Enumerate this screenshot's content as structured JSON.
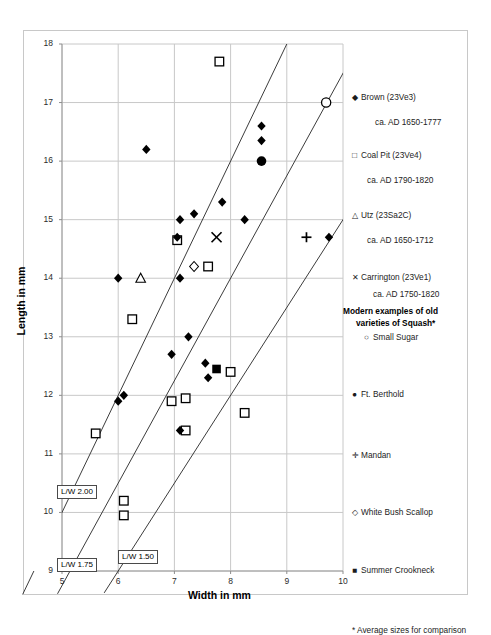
{
  "chart_data": {
    "type": "scatter",
    "title": "",
    "xlabel": "Width in mm",
    "ylabel": "Length in mm",
    "xlim": [
      5,
      10
    ],
    "ylim": [
      9,
      18
    ],
    "xticks": [
      5,
      6,
      7,
      8,
      9,
      10
    ],
    "yticks": [
      9,
      10,
      11,
      12,
      13,
      14,
      15,
      16,
      17,
      18
    ],
    "grid": true,
    "legend_position": "right",
    "series": [
      {
        "name": "Brown (23Ve3)",
        "marker": "filled-diamond",
        "points": [
          [
            6.5,
            16.2
          ],
          [
            8.55,
            16.6
          ],
          [
            8.55,
            16.35
          ],
          [
            7.85,
            15.3
          ],
          [
            7.35,
            15.1
          ],
          [
            8.25,
            15.0
          ],
          [
            7.1,
            15.0
          ],
          [
            7.05,
            14.7
          ],
          [
            9.75,
            14.7
          ],
          [
            6.0,
            14.0
          ],
          [
            7.1,
            14.0
          ],
          [
            7.25,
            13.0
          ],
          [
            6.95,
            12.7
          ],
          [
            7.55,
            12.55
          ],
          [
            7.6,
            12.3
          ],
          [
            6.1,
            12.0
          ],
          [
            6.0,
            11.9
          ],
          [
            7.1,
            11.4
          ]
        ]
      },
      {
        "name": "Coal Pit (23Ve4)",
        "marker": "open-square",
        "points": [
          [
            7.8,
            17.7
          ],
          [
            7.05,
            14.65
          ],
          [
            7.6,
            14.2
          ],
          [
            6.25,
            13.3
          ],
          [
            8.0,
            12.4
          ],
          [
            6.95,
            11.9
          ],
          [
            7.2,
            11.95
          ],
          [
            7.2,
            11.4
          ],
          [
            8.25,
            11.7
          ],
          [
            5.6,
            11.35
          ],
          [
            6.1,
            10.2
          ],
          [
            6.1,
            9.95
          ]
        ]
      },
      {
        "name": "Utz (23Sa2C)",
        "marker": "open-triangle",
        "points": [
          [
            6.4,
            14.0
          ]
        ]
      },
      {
        "name": "Carrington (23Ve1)",
        "marker": "cross-x",
        "points": [
          [
            7.75,
            14.7
          ]
        ]
      },
      {
        "name": "Small Sugar",
        "marker": "open-circle",
        "points": [
          [
            9.7,
            17.0
          ]
        ]
      },
      {
        "name": "Ft. Berthold",
        "marker": "filled-circle",
        "points": [
          [
            8.55,
            16.0
          ]
        ]
      },
      {
        "name": "Mandan",
        "marker": "plus",
        "points": [
          [
            9.35,
            14.7
          ]
        ]
      },
      {
        "name": "White Bush Scallop",
        "marker": "open-diamond",
        "points": [
          [
            7.35,
            14.2
          ]
        ]
      },
      {
        "name": "Summer Crookneck",
        "marker": "filled-square",
        "points": [
          [
            7.75,
            12.45
          ]
        ]
      }
    ],
    "reference_lines": [
      {
        "label": "L/W 2.00",
        "ratio": 2.0
      },
      {
        "label": "L/W 1.75",
        "ratio": 1.75
      },
      {
        "label": "L/W 1.50",
        "ratio": 1.5
      }
    ]
  },
  "axes": {
    "x_title": "Width in mm",
    "y_title": "Length in mm",
    "x_tick_labels": [
      "5",
      "6",
      "7",
      "8",
      "9",
      "10"
    ],
    "y_tick_labels": [
      "9",
      "10",
      "11",
      "12",
      "13",
      "14",
      "15",
      "16",
      "17",
      "18"
    ]
  },
  "reference_labels": [
    {
      "text": "L/W 2.00"
    },
    {
      "text": "L/W 1.75"
    },
    {
      "text": "L/W 1.50"
    }
  ],
  "legend": {
    "entries": [
      {
        "symbol": "◆",
        "label": "Brown (23Ve3)",
        "icon": "filled-diamond-icon"
      },
      {
        "symbol": "",
        "label": "ca. AD 1650-1777",
        "icon": "date-text"
      },
      {
        "symbol": "□",
        "label": "Coal Pit (23Ve4)",
        "icon": "open-square-icon"
      },
      {
        "symbol": "",
        "label": "ca. AD 1790-1820",
        "icon": "date-text"
      },
      {
        "symbol": "△",
        "label": "Utz (23Sa2C)",
        "icon": "open-triangle-icon"
      },
      {
        "symbol": "",
        "label": "ca. AD 1650-1712",
        "icon": "date-text"
      },
      {
        "symbol": "✕",
        "label": "Carrington (23Ve1)",
        "icon": "cross-x-icon"
      },
      {
        "symbol": "",
        "label": "ca. AD 1750-1820",
        "icon": "date-text"
      }
    ],
    "modern_heading_line1": "Modern examples of old",
    "modern_heading_line2": "varieties of Squash*",
    "modern_entries": [
      {
        "symbol": "○",
        "label": "Small Sugar",
        "icon": "open-circle-icon"
      },
      {
        "symbol": "●",
        "label": "Ft. Berthold",
        "icon": "filled-circle-icon"
      },
      {
        "symbol": "✛",
        "label": "Mandan",
        "icon": "plus-icon"
      },
      {
        "symbol": "◇",
        "label": "White Bush Scallop",
        "icon": "open-diamond-icon"
      },
      {
        "symbol": "■",
        "label": "Summer Crookneck",
        "icon": "filled-square-icon"
      }
    ],
    "footnote": "* Average sizes for comparison"
  },
  "colors": {
    "marker": "#000000",
    "grid": "#c8c8c8",
    "axis": "#808080",
    "text": "#1c1c1c"
  }
}
